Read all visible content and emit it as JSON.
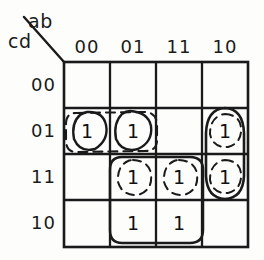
{
  "diagram": {
    "type": "karnaugh-map",
    "variables_top": "ab",
    "variables_left": "cd",
    "column_headers": [
      "00",
      "01",
      "11",
      "10"
    ],
    "row_headers": [
      "00",
      "01",
      "11",
      "10"
    ],
    "ink_color": "#1a1a1a",
    "background_color": "#fdfdfc",
    "cells": [
      {
        "row": "00",
        "col": "00",
        "value": ""
      },
      {
        "row": "00",
        "col": "01",
        "value": ""
      },
      {
        "row": "00",
        "col": "11",
        "value": ""
      },
      {
        "row": "00",
        "col": "10",
        "value": ""
      },
      {
        "row": "01",
        "col": "00",
        "value": "1"
      },
      {
        "row": "01",
        "col": "01",
        "value": "1"
      },
      {
        "row": "01",
        "col": "11",
        "value": ""
      },
      {
        "row": "01",
        "col": "10",
        "value": "1"
      },
      {
        "row": "11",
        "col": "00",
        "value": ""
      },
      {
        "row": "11",
        "col": "01",
        "value": "1"
      },
      {
        "row": "11",
        "col": "11",
        "value": "1"
      },
      {
        "row": "11",
        "col": "10",
        "value": "1"
      },
      {
        "row": "10",
        "col": "00",
        "value": ""
      },
      {
        "row": "10",
        "col": "01",
        "value": "1"
      },
      {
        "row": "10",
        "col": "11",
        "value": "1"
      },
      {
        "row": "10",
        "col": "10",
        "value": ""
      }
    ],
    "groups": [
      {
        "name": "solid-circle-r01-c00",
        "style": "solid",
        "shape": "circle"
      },
      {
        "name": "solid-circle-r01-c01",
        "style": "solid",
        "shape": "circle"
      },
      {
        "name": "dashed-pair-r01-c00-c01",
        "style": "dashed",
        "shape": "rounded-rect"
      },
      {
        "name": "solid-oval-c10-r01-r11",
        "style": "solid",
        "shape": "tall-oval"
      },
      {
        "name": "dashed-circle-r01-c10",
        "style": "dashed",
        "shape": "circle"
      },
      {
        "name": "dashed-circle-r11-c10",
        "style": "dashed",
        "shape": "circle"
      },
      {
        "name": "solid-quad-r11-r10-c01-c11",
        "style": "solid",
        "shape": "rounded-rect"
      },
      {
        "name": "dashed-circle-r11-c01",
        "style": "dashed",
        "shape": "circle"
      },
      {
        "name": "dashed-circle-r11-c11",
        "style": "dashed",
        "shape": "circle"
      }
    ]
  }
}
